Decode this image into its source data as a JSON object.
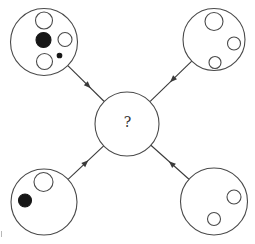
{
  "figure": {
    "background": "#ffffff",
    "stroke_color": "#4a4a4a",
    "line_color": "#3a3a3a",
    "black_fill": "#161616",
    "white_fill": "#ffffff",
    "stroke_width": 1.1,
    "center_node": {
      "id": "center",
      "label": "?",
      "x": 127,
      "y": 124,
      "r": 32
    },
    "nodes": [
      {
        "id": "top-left",
        "x": 44,
        "y": 42,
        "r": 33.5,
        "dots": [
          {
            "x": 44,
            "y": 20.5,
            "r": 8.5,
            "fill": "white"
          },
          {
            "x": 43.5,
            "y": 40,
            "r": 7.5,
            "fill": "black"
          },
          {
            "x": 65,
            "y": 39.5,
            "r": 7,
            "fill": "white"
          },
          {
            "x": 59.5,
            "y": 55.5,
            "r": 2.3,
            "fill": "black"
          },
          {
            "x": 44.5,
            "y": 61.5,
            "r": 8,
            "fill": "white"
          }
        ]
      },
      {
        "id": "top-right",
        "x": 214,
        "y": 39.5,
        "r": 31,
        "dots": [
          {
            "x": 214,
            "y": 21.5,
            "r": 9,
            "fill": "white"
          },
          {
            "x": 234,
            "y": 43.5,
            "r": 6.5,
            "fill": "white"
          },
          {
            "x": 215,
            "y": 62.5,
            "r": 6,
            "fill": "white"
          }
        ]
      },
      {
        "id": "bottom-left",
        "x": 44,
        "y": 202,
        "r": 33,
        "dots": [
          {
            "x": 43.5,
            "y": 182,
            "r": 9.5,
            "fill": "white"
          },
          {
            "x": 25,
            "y": 200.5,
            "r": 6.5,
            "fill": "black"
          }
        ]
      },
      {
        "id": "bottom-right",
        "x": 214,
        "y": 201.5,
        "r": 33.5,
        "dots": [
          {
            "x": 234,
            "y": 197,
            "r": 7,
            "fill": "white"
          },
          {
            "x": 214,
            "y": 219,
            "r": 6.5,
            "fill": "white"
          }
        ]
      }
    ],
    "arrows": [
      {
        "from": "top-left",
        "to": "center",
        "head_fraction": 0.63
      },
      {
        "from": "top-right",
        "to": "center",
        "head_fraction": 0.52
      },
      {
        "from": "bottom-left",
        "to": "center",
        "head_fraction": 0.57
      },
      {
        "from": "bottom-right",
        "to": "center",
        "head_fraction": 0.53
      }
    ],
    "head_length": 7,
    "head_half_width": 2.8,
    "artifacts": [
      {
        "x1": 1.5,
        "y1": 231,
        "x2": 1.5,
        "y2": 237,
        "color": "#b8b8b8"
      }
    ]
  }
}
